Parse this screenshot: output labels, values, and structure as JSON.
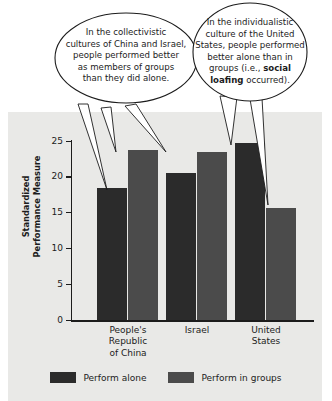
{
  "figure": {
    "panel_color": "#e9e9e7",
    "background": "#ffffff"
  },
  "chart_data": {
    "type": "bar",
    "title": "",
    "xlabel": "",
    "ylabel": "Standardized Performance Measure",
    "ylabel_lines": [
      "Standardized",
      "Performance Measure"
    ],
    "ylim": [
      0,
      25
    ],
    "yticks": [
      0,
      5,
      10,
      15,
      20,
      25
    ],
    "ytick_labels": [
      "0",
      "5",
      "10",
      "15",
      "20",
      "25"
    ],
    "grid": false,
    "legend_position": "bottom",
    "categories": [
      "People's Republic of China",
      "Israel",
      "United States"
    ],
    "category_lines": [
      [
        "People's",
        "Republic",
        "of China"
      ],
      [
        "Israel"
      ],
      [
        "United",
        "States"
      ]
    ],
    "series": [
      {
        "name": "Perform alone",
        "color": "#2b2b2b",
        "values": [
          18.5,
          20.6,
          24.7
        ]
      },
      {
        "name": "Perform in groups",
        "color": "#4b4b4b",
        "values": [
          23.7,
          23.4,
          15.6
        ]
      }
    ]
  },
  "legend": {
    "items": [
      {
        "label": "Perform alone",
        "color": "#2b2b2b"
      },
      {
        "label": "Perform in groups",
        "color": "#4b4b4b"
      }
    ]
  },
  "callouts": [
    {
      "id": "collectivistic-callout",
      "lines": [
        "In the collectivistic",
        "cultures of China and Israel,",
        "people performed better",
        "as members of groups",
        "than they did alone."
      ]
    },
    {
      "id": "individualistic-callout",
      "lines": [
        "In the individualistic",
        "culture of the United",
        "States, people performed",
        "better alone than in",
        "groups (i.e., social",
        "loafing occurred)."
      ],
      "bold_terms": [
        "social",
        "loafing"
      ]
    }
  ]
}
